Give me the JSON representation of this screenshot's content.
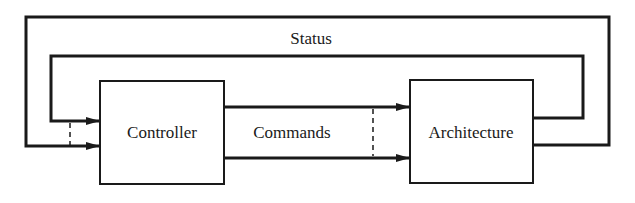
{
  "diagram": {
    "type": "block-diagram",
    "blocks": [
      {
        "id": "controller",
        "label": "Controller"
      },
      {
        "id": "architecture",
        "label": "Architecture"
      }
    ],
    "edges": [
      {
        "from": "controller",
        "to": "architecture",
        "label": "Commands",
        "count": 2
      },
      {
        "from": "architecture",
        "to": "controller",
        "label": "Status",
        "count": 2
      }
    ],
    "labels": {
      "status": "Status",
      "commands": "Commands"
    },
    "colors": {
      "line": "#1a1a1a",
      "background": "#ffffff"
    }
  }
}
